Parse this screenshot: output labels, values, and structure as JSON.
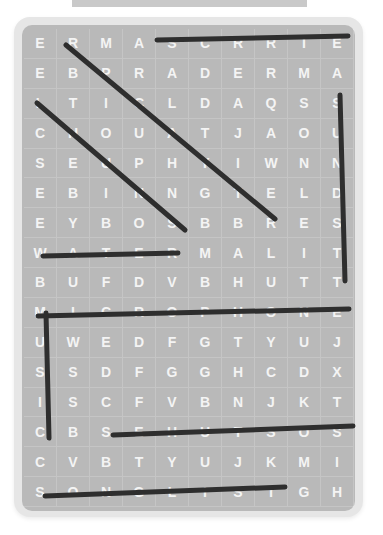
{
  "puzzle": {
    "rows": [
      [
        "E",
        "R",
        "M",
        "A",
        "S",
        "C",
        "R",
        "R",
        "I",
        "E"
      ],
      [
        "E",
        "B",
        "P",
        "R",
        "A",
        "D",
        "E",
        "R",
        "M",
        "A"
      ],
      [
        "L",
        "T",
        "I",
        "C",
        "L",
        "D",
        "A",
        "Q",
        "S",
        "S"
      ],
      [
        "C",
        "H",
        "O",
        "U",
        "A",
        "T",
        "J",
        "A",
        "O",
        "U"
      ],
      [
        "S",
        "E",
        "U",
        "P",
        "H",
        "Y",
        "I",
        "W",
        "N",
        "N"
      ],
      [
        "E",
        "B",
        "I",
        "N",
        "N",
        "G",
        "T",
        "E",
        "L",
        "D"
      ],
      [
        "E",
        "Y",
        "B",
        "O",
        "S",
        "B",
        "B",
        "R",
        "E",
        "S"
      ],
      [
        "W",
        "A",
        "T",
        "E",
        "R",
        "M",
        "A",
        "L",
        "I",
        "T"
      ],
      [
        "B",
        "U",
        "F",
        "D",
        "V",
        "B",
        "H",
        "U",
        "T",
        "T"
      ],
      [
        "M",
        "I",
        "C",
        "R",
        "O",
        "P",
        "H",
        "O",
        "N",
        "E"
      ],
      [
        "U",
        "W",
        "E",
        "D",
        "F",
        "G",
        "T",
        "Y",
        "U",
        "J"
      ],
      [
        "S",
        "S",
        "D",
        "F",
        "G",
        "G",
        "H",
        "C",
        "D",
        "X"
      ],
      [
        "I",
        "S",
        "C",
        "F",
        "V",
        "B",
        "N",
        "J",
        "K",
        "T"
      ],
      [
        "C",
        "B",
        "S",
        "E",
        "H",
        "U",
        "T",
        "S",
        "O",
        "S"
      ],
      [
        "C",
        "V",
        "B",
        "T",
        "Y",
        "U",
        "J",
        "K",
        "M",
        "I"
      ],
      [
        "S",
        "O",
        "N",
        "G",
        "L",
        "I",
        "S",
        "T",
        "G",
        "H"
      ]
    ]
  },
  "found_lines": [
    {
      "x1": 157,
      "y1": 40,
      "x2": 348,
      "y2": 36
    },
    {
      "x1": 66,
      "y1": 45,
      "x2": 275,
      "y2": 219
    },
    {
      "x1": 37,
      "y1": 103,
      "x2": 185,
      "y2": 230
    },
    {
      "x1": 340,
      "y1": 95,
      "x2": 345,
      "y2": 281
    },
    {
      "x1": 43,
      "y1": 256,
      "x2": 178,
      "y2": 253
    },
    {
      "x1": 38,
      "y1": 316,
      "x2": 349,
      "y2": 309
    },
    {
      "x1": 46,
      "y1": 313,
      "x2": 49,
      "y2": 438
    },
    {
      "x1": 113,
      "y1": 435,
      "x2": 353,
      "y2": 426
    },
    {
      "x1": 45,
      "y1": 496,
      "x2": 285,
      "y2": 487
    }
  ],
  "colors": {
    "board": "#b9b9b9",
    "card": "#e6e6e6",
    "letters": "#f4f4f4",
    "lines": "#2e2e2e"
  }
}
